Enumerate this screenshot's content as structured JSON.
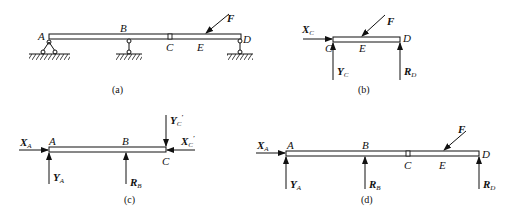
{
  "figures": [
    {
      "id": "a",
      "caption": "(a)",
      "description": "Compound beam ABCD with fixed pin support at A, roller supports at B and D, internal hinge at C, inclined load F applied at E",
      "points": {
        "A": "A",
        "B": "B",
        "C": "C",
        "D": "D",
        "E": "E"
      },
      "loads": {
        "F": "F"
      }
    },
    {
      "id": "b",
      "caption": "(b)",
      "description": "Free body of segment CD",
      "points": {
        "C": "C",
        "D": "D",
        "E": "E"
      },
      "forces": {
        "F": "F",
        "XC": "X",
        "XC_sub": "C",
        "YC": "Y",
        "YC_sub": "C",
        "RD": "R",
        "RD_sub": "D"
      }
    },
    {
      "id": "c",
      "caption": "(c)",
      "description": "Free body of segment AC",
      "points": {
        "A": "A",
        "B": "B",
        "C": "C"
      },
      "forces": {
        "XA": "X",
        "XA_sub": "A",
        "YA": "Y",
        "YA_sub": "A",
        "RB": "R",
        "RB_sub": "B",
        "YCp": "Y",
        "YCp_sub": "C",
        "XCp": "X",
        "XCp_sub": "C",
        "prime": "′"
      }
    },
    {
      "id": "d",
      "caption": "(d)",
      "description": "Free body of whole beam AD",
      "points": {
        "A": "A",
        "B": "B",
        "C": "C",
        "D": "D",
        "E": "E"
      },
      "forces": {
        "F": "F",
        "XA": "X",
        "XA_sub": "A",
        "YA": "Y",
        "YA_sub": "A",
        "RB": "R",
        "RB_sub": "B",
        "RD": "R",
        "RD_sub": "D"
      }
    }
  ],
  "colors": {
    "ink": "#111111",
    "background": "#ffffff"
  }
}
